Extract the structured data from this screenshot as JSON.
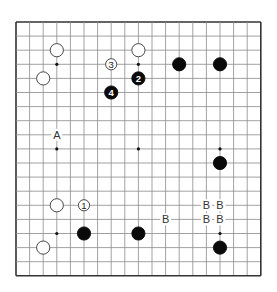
{
  "board": {
    "size": 19,
    "origin": [
      16,
      22
    ],
    "spacing": [
      13.6,
      14.1
    ],
    "line_color": "#8a8a8a",
    "border_color": "#333333",
    "star_points": [
      [
        3,
        3
      ],
      [
        9,
        3
      ],
      [
        15,
        3
      ],
      [
        3,
        9
      ],
      [
        9,
        9
      ],
      [
        15,
        9
      ],
      [
        3,
        15
      ],
      [
        9,
        15
      ],
      [
        15,
        15
      ]
    ]
  },
  "stones": [
    {
      "color": "white",
      "col": 3,
      "row": 2,
      "label": ""
    },
    {
      "color": "white",
      "col": 2,
      "row": 4,
      "label": ""
    },
    {
      "color": "white",
      "col": 9,
      "row": 2,
      "label": ""
    },
    {
      "color": "white",
      "col": 7,
      "row": 3,
      "label": "3"
    },
    {
      "color": "black",
      "col": 9,
      "row": 4,
      "label": "2"
    },
    {
      "color": "black",
      "col": 7,
      "row": 5,
      "label": "4"
    },
    {
      "color": "black",
      "col": 12,
      "row": 3,
      "label": ""
    },
    {
      "color": "black",
      "col": 15,
      "row": 3,
      "label": ""
    },
    {
      "color": "black",
      "col": 15,
      "row": 10,
      "label": ""
    },
    {
      "color": "white",
      "col": 3,
      "row": 13,
      "label": ""
    },
    {
      "color": "white",
      "col": 5,
      "row": 13,
      "label": "1"
    },
    {
      "color": "black",
      "col": 5,
      "row": 15,
      "label": ""
    },
    {
      "color": "black",
      "col": 9,
      "row": 15,
      "label": ""
    },
    {
      "color": "white",
      "col": 2,
      "row": 16,
      "label": ""
    },
    {
      "color": "black",
      "col": 15,
      "row": 16,
      "label": ""
    }
  ],
  "marks": [
    {
      "text": "A",
      "col": 3,
      "row": 8
    },
    {
      "text": "B",
      "col": 11,
      "row": 14
    },
    {
      "text": "B",
      "col": 14,
      "row": 13
    },
    {
      "text": "B",
      "col": 15,
      "row": 13
    },
    {
      "text": "B",
      "col": 14,
      "row": 14
    },
    {
      "text": "B",
      "col": 15,
      "row": 14
    }
  ]
}
